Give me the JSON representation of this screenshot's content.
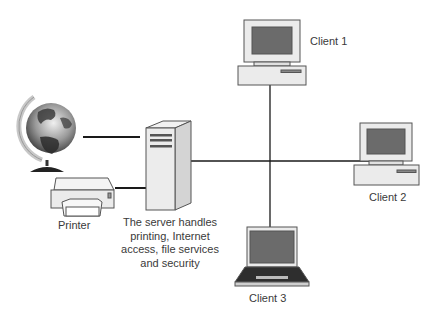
{
  "diagram": {
    "title": "",
    "nodes": {
      "internet": {
        "icon": "globe-icon"
      },
      "printer": {
        "label": "Printer",
        "icon": "printer-icon"
      },
      "server": {
        "icon": "server-tower-icon",
        "description_lines": [
          "The server handles",
          "printing, Internet",
          "access, file services",
          "and security"
        ]
      },
      "client1": {
        "label": "Client 1",
        "icon": "desktop-computer-icon"
      },
      "client2": {
        "label": "Client 2",
        "icon": "desktop-computer-icon"
      },
      "client3": {
        "label": "Client 3",
        "icon": "laptop-icon"
      }
    },
    "edges": [
      {
        "from": "internet",
        "to": "server"
      },
      {
        "from": "printer",
        "to": "server"
      },
      {
        "from": "server",
        "to": "client2"
      },
      {
        "from": "client1",
        "to": "client3",
        "crosses": "server-client2 line"
      }
    ],
    "colors": {
      "line": "#1a1a1a",
      "device_body": "#ebebeb",
      "device_outline": "#555555",
      "screen": "#6b6b6b",
      "text": "#3a3a3a"
    }
  }
}
